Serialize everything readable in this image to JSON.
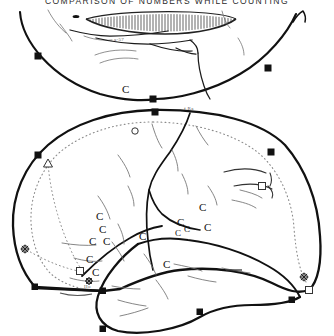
{
  "plate": {
    "title": "COMPARISON  OF  NUMBERS  WHILE  COUNTING",
    "title_visible_clipped": true,
    "background_color": "#ffffff",
    "ink_color": "#111111",
    "dotted_color": "#8a8a8a",
    "hairline_color": "#4a4a4a",
    "width_px": 334,
    "height_px": 336
  },
  "figures": [
    {
      "id": "upper-figure",
      "name": "upper-outline-shape",
      "description": "broad shallow dome / lens shaped outline, open at top, with hatched crescent band",
      "markers": [
        {
          "type": "filled-square",
          "x": 38,
          "y": 56
        },
        {
          "type": "filled-square",
          "x": 268,
          "y": 68
        },
        {
          "type": "filled-square",
          "x": 153,
          "y": 99
        }
      ],
      "hatch_band": {
        "name": "hatched-crescent",
        "segments": 54
      }
    },
    {
      "id": "lower-figure",
      "name": "lower-outline-shape",
      "description": "large rounded dome outline with dotted inner contour, interior sulcus lines and lobe",
      "markers": [
        {
          "type": "filled-square",
          "x": 155,
          "y": 112
        },
        {
          "type": "filled-square",
          "x": 38,
          "y": 155
        },
        {
          "type": "filled-square",
          "x": 271,
          "y": 152
        },
        {
          "type": "open-triangle",
          "x": 48,
          "y": 163
        },
        {
          "type": "open-square",
          "x": 262,
          "y": 186
        },
        {
          "type": "open-circle",
          "x": 135,
          "y": 131
        },
        {
          "type": "star",
          "x": 25,
          "y": 249
        },
        {
          "type": "star",
          "x": 304,
          "y": 277
        },
        {
          "type": "open-square",
          "x": 80,
          "y": 271
        },
        {
          "type": "open-square",
          "x": 309,
          "y": 290
        },
        {
          "type": "filled-square",
          "x": 35,
          "y": 287
        },
        {
          "type": "filled-square",
          "x": 103,
          "y": 291
        },
        {
          "type": "filled-square",
          "x": 200,
          "y": 312
        },
        {
          "type": "filled-square",
          "x": 103,
          "y": 329
        },
        {
          "type": "filled-square",
          "x": 292,
          "y": 300
        }
      ]
    }
  ],
  "annotations": {
    "letter_labels": [
      {
        "text": "C",
        "x": 126,
        "y": 92,
        "size": "normal"
      },
      {
        "text": "C",
        "x": 100,
        "y": 216,
        "size": "normal"
      },
      {
        "text": "C",
        "x": 103,
        "y": 229,
        "size": "normal"
      },
      {
        "text": "C",
        "x": 94,
        "y": 241,
        "size": "normal"
      },
      {
        "text": "C",
        "x": 107,
        "y": 241,
        "size": "normal"
      },
      {
        "text": "C",
        "x": 91,
        "y": 259,
        "size": "normal"
      },
      {
        "text": "C",
        "x": 181,
        "y": 222,
        "size": "normal"
      },
      {
        "text": "C",
        "x": 187,
        "y": 228,
        "size": "sm"
      },
      {
        "text": "C",
        "x": 178,
        "y": 231,
        "size": "sm"
      },
      {
        "text": "C",
        "x": 203,
        "y": 207,
        "size": "normal"
      },
      {
        "text": "C",
        "x": 208,
        "y": 227,
        "size": "normal"
      },
      {
        "text": "C",
        "x": 143,
        "y": 236,
        "size": "normal"
      },
      {
        "text": "C",
        "x": 167,
        "y": 264,
        "size": "normal"
      },
      {
        "text": "C",
        "x": 96,
        "y": 272,
        "size": "normal"
      }
    ],
    "tiny_labels": [
      {
        "text": "a-57",
        "x": 118,
        "y": 41
      },
      {
        "text": "f Ra",
        "x": 189,
        "y": 110
      },
      {
        "text": "Ho",
        "x": 88,
        "y": 287
      }
    ]
  }
}
